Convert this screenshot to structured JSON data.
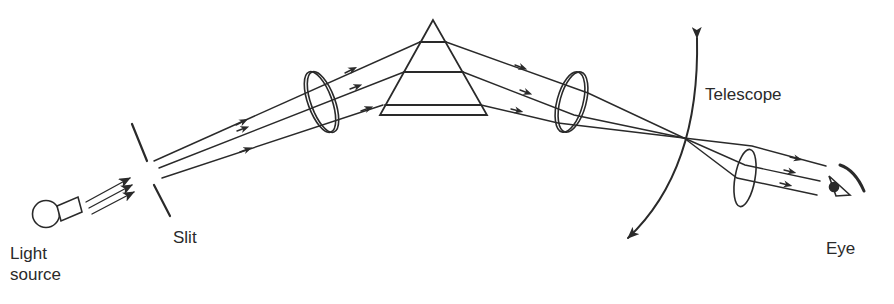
{
  "diagram": {
    "type": "spectrometer-schematic",
    "stroke_color": "#2a2a2a",
    "background": "#ffffff",
    "labels": {
      "light_source_line1": "Light",
      "light_source_line2": "source",
      "slit": "Slit",
      "telescope": "Telescope",
      "eye": "Eye"
    },
    "components": [
      {
        "name": "light-source",
        "label": "Light source"
      },
      {
        "name": "slit",
        "label": "Slit"
      },
      {
        "name": "collimator-lens",
        "label": ""
      },
      {
        "name": "prism",
        "label": ""
      },
      {
        "name": "objective-lens",
        "label": ""
      },
      {
        "name": "telescope-rotation-arc",
        "label": "Telescope"
      },
      {
        "name": "eyepiece-lens",
        "label": ""
      },
      {
        "name": "eye",
        "label": "Eye"
      }
    ]
  }
}
